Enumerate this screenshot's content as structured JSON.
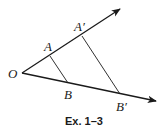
{
  "figure": {
    "caption": "Ex. 1–3",
    "labels": {
      "O": "O",
      "A": "A",
      "B": "B",
      "A_prime": "A′",
      "B_prime": "B′"
    },
    "colors": {
      "stroke": "#1a1a1a",
      "background": "#ffffff"
    },
    "points": {
      "O": [
        22,
        73
      ],
      "A": [
        50,
        56
      ],
      "B": [
        68,
        83
      ],
      "A_prime": [
        82,
        36
      ],
      "B_prime": [
        120,
        94
      ],
      "upper_ray_tip": [
        121,
        8
      ],
      "lower_ray_tip": [
        157,
        101
      ]
    },
    "segments": [
      {
        "name": "AB",
        "from": "A",
        "to": "B"
      },
      {
        "name": "A'B'",
        "from": "A_prime",
        "to": "B_prime"
      }
    ],
    "rays": [
      {
        "name": "upper-ray",
        "from": "O",
        "through": [
          "A",
          "A_prime"
        ]
      },
      {
        "name": "lower-ray",
        "from": "O",
        "through": [
          "B",
          "B_prime"
        ]
      }
    ]
  }
}
